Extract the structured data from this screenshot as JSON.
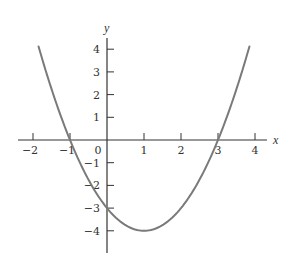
{
  "chart_data": {
    "type": "line",
    "title": "",
    "xlabel": "x",
    "ylabel": "y",
    "function": "y = x^2 - 2x - 3",
    "xlim": [
      -2.4,
      4.3
    ],
    "ylim": [
      -5,
      4.6
    ],
    "grid": false,
    "legend": null,
    "x_ticks": [
      -2,
      -1,
      0,
      1,
      2,
      3,
      4
    ],
    "x_tick_labels": [
      "−2",
      "−1",
      "0",
      "1",
      "2",
      "3",
      "4"
    ],
    "y_ticks": [
      4,
      3,
      2,
      1,
      -1,
      -2,
      -3,
      -4
    ],
    "y_tick_labels": [
      "4",
      "3",
      "2",
      "1",
      "−1",
      "−2",
      "−3",
      "−4"
    ],
    "series": [
      {
        "name": "parabola",
        "x_range": [
          -1.85,
          3.85
        ],
        "coefficients": {
          "a": 1,
          "b": -2,
          "c": -3
        },
        "key_points": {
          "roots": [
            -1,
            3
          ],
          "y_intercept": -3,
          "vertex": [
            1,
            -4
          ]
        }
      }
    ]
  },
  "colors": {
    "axis": "#333333",
    "curve": "#7a7a7a",
    "background": "#ffffff"
  },
  "layout": {
    "origin_px": [
      107,
      140
    ],
    "x_unit_px": 37,
    "y_unit_px": 22.7,
    "x_axis_px": [
      18,
      267
    ],
    "y_axis_px": [
      38,
      253
    ],
    "tick_len": 7
  }
}
